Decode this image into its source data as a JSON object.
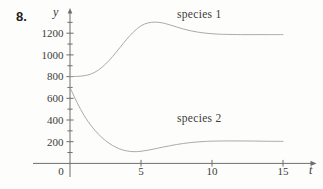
{
  "problem_number": "8.",
  "colors": {
    "background": "#fdfdfb",
    "axis": "#6e6e6e",
    "curve": "#a0a0a0",
    "text": "#3c3c3c"
  },
  "chart_data": {
    "type": "line",
    "title": "",
    "xlabel": "t",
    "ylabel": "y",
    "xlim": [
      0,
      15.6
    ],
    "ylim": [
      0,
      1390
    ],
    "grid": false,
    "legend_position": "inline-annotations",
    "x_ticks": [
      0,
      5,
      10,
      15
    ],
    "y_tick_labels": [
      200,
      400,
      600,
      800,
      1000,
      1200
    ],
    "y_minor_tick_step": 100,
    "y_minor_tick_max": 1300,
    "series": [
      {
        "name": "species 1",
        "label": "species 1",
        "points": [
          [
            0,
            800
          ],
          [
            0.5,
            802
          ],
          [
            1,
            808
          ],
          [
            1.5,
            825
          ],
          [
            2,
            860
          ],
          [
            2.5,
            915
          ],
          [
            3,
            985
          ],
          [
            3.5,
            1065
          ],
          [
            4,
            1145
          ],
          [
            4.5,
            1215
          ],
          [
            5,
            1268
          ],
          [
            5.5,
            1295
          ],
          [
            6,
            1302
          ],
          [
            6.5,
            1295
          ],
          [
            7,
            1278
          ],
          [
            7.5,
            1258
          ],
          [
            8,
            1238
          ],
          [
            8.5,
            1222
          ],
          [
            9,
            1210
          ],
          [
            9.5,
            1201
          ],
          [
            10,
            1195
          ],
          [
            10.5,
            1191
          ],
          [
            11,
            1189
          ],
          [
            12,
            1187
          ],
          [
            13,
            1187
          ],
          [
            14,
            1187
          ],
          [
            15,
            1187
          ]
        ]
      },
      {
        "name": "species 2",
        "label": "species 2",
        "points": [
          [
            0,
            700
          ],
          [
            0.5,
            560
          ],
          [
            1,
            440
          ],
          [
            1.5,
            345
          ],
          [
            2,
            270
          ],
          [
            2.5,
            210
          ],
          [
            3,
            165
          ],
          [
            3.5,
            133
          ],
          [
            4,
            115
          ],
          [
            4.5,
            108
          ],
          [
            5,
            112
          ],
          [
            5.5,
            122
          ],
          [
            6,
            135
          ],
          [
            6.5,
            149
          ],
          [
            7,
            162
          ],
          [
            7.5,
            174
          ],
          [
            8,
            184
          ],
          [
            8.5,
            192
          ],
          [
            9,
            198
          ],
          [
            9.5,
            202
          ],
          [
            10,
            205
          ],
          [
            11,
            207
          ],
          [
            12,
            207
          ],
          [
            13,
            206
          ],
          [
            14,
            204
          ],
          [
            15,
            203
          ]
        ]
      }
    ]
  }
}
